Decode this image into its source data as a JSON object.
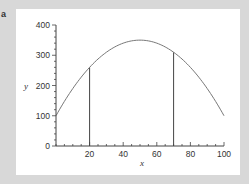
{
  "panel_label": "a",
  "colors": {
    "background": "#d8d8d8",
    "panel": "#ffffff",
    "axis": "#444444",
    "curve": "#777777",
    "text": "#333333"
  },
  "chart_data": {
    "type": "line",
    "title": "",
    "xlabel": "x",
    "ylabel": "y",
    "xlim": [
      0,
      100
    ],
    "ylim": [
      0,
      400
    ],
    "x_ticks": [
      20,
      40,
      60,
      80,
      100
    ],
    "x_tick_labels": [
      "20",
      "40",
      "60",
      "80",
      "100"
    ],
    "x_minor_step": 5,
    "y_ticks": [
      0,
      100,
      200,
      300,
      400
    ],
    "y_tick_labels": [
      "0",
      "100",
      "200",
      "300",
      "400"
    ],
    "y_minor_step": 20,
    "grid": false,
    "legend": null,
    "series": [
      {
        "name": "curve",
        "equation": "y = 350 - 0.1*(x-50)^2",
        "x": [
          0,
          10,
          20,
          30,
          40,
          50,
          60,
          70,
          80,
          90,
          100
        ],
        "y": [
          100,
          190,
          260,
          310,
          340,
          350,
          340,
          310,
          260,
          190,
          100
        ]
      }
    ],
    "annotations": [
      {
        "type": "vertical-line",
        "x": 20,
        "y_from": 0,
        "y_to": 260
      },
      {
        "type": "vertical-line",
        "x": 70,
        "y_from": 0,
        "y_to": 310
      }
    ]
  }
}
